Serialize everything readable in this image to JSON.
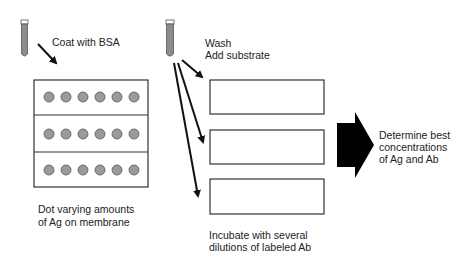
{
  "diagram": {
    "type": "checkerboard-titration-dot-blot",
    "labels": {
      "coat": "Coat with BSA",
      "wash": "Wash",
      "add_substrate": "Add substrate",
      "dot_line1": "Dot varying amounts",
      "dot_line2": "of Ag on membrane",
      "incubate_line1": "Incubate with several",
      "incubate_line2": "dilutions of labeled Ab",
      "determine_line1": "Determine best",
      "determine_line2": "concentrations",
      "determine_line3": "of Ag and Ab"
    },
    "membrane": {
      "rows": 3,
      "dots_per_row": 6
    },
    "strips": {
      "count": 3
    },
    "colors": {
      "line": "#222222",
      "dot_fill": "#9a9a9a",
      "tube_fill": "#8c8c8c",
      "arrow_fill": "#000000"
    }
  }
}
